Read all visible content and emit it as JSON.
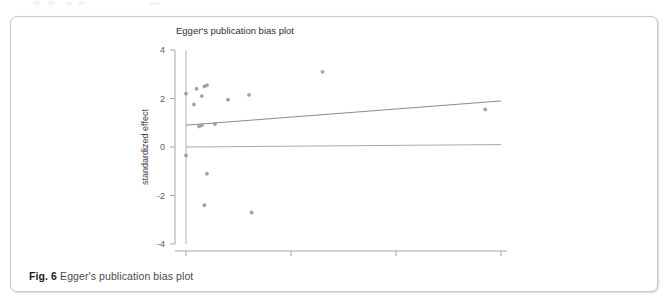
{
  "figure": {
    "caption_label": "Fig. 6",
    "caption_text": "Egger's publication bias plot"
  },
  "chart_data": {
    "type": "scatter",
    "title": "Egger's publication bias plot",
    "xlabel": "precision",
    "ylabel": "standardized effect",
    "xlim": [
      -1.5,
      61
    ],
    "ylim": [
      -4.3,
      4.3
    ],
    "xticks": [
      0,
      20,
      40,
      60
    ],
    "xtick_labels": [
      "0",
      "20",
      "40",
      "60"
    ],
    "yticks": [
      4,
      2,
      0,
      -2,
      -4
    ],
    "ytick_labels": [
      "4",
      "2",
      "0",
      "-2",
      "-4"
    ],
    "grid": false,
    "legend": "none",
    "x": [
      0,
      0,
      1.5,
      2,
      2.5,
      3,
      3,
      3.5,
      3.5,
      4,
      4,
      5.5,
      8,
      12,
      12.5,
      26,
      57
    ],
    "y": [
      2.2,
      -0.35,
      1.75,
      2.4,
      0.85,
      2.1,
      0.9,
      2.5,
      -2.4,
      2.55,
      -1.1,
      0.95,
      1.95,
      2.15,
      -2.7,
      3.1,
      1.55
    ],
    "points": [
      {
        "precision": 0,
        "standardized_effect": 2.2
      },
      {
        "precision": 0,
        "standardized_effect": -0.35
      },
      {
        "precision": 1.5,
        "standardized_effect": 1.75
      },
      {
        "precision": 2,
        "standardized_effect": 2.4
      },
      {
        "precision": 2.5,
        "standardized_effect": 0.85
      },
      {
        "precision": 3,
        "standardized_effect": 2.1
      },
      {
        "precision": 3,
        "standardized_effect": 0.9
      },
      {
        "precision": 3.5,
        "standardized_effect": 2.5
      },
      {
        "precision": 3.5,
        "standardized_effect": -2.4
      },
      {
        "precision": 4,
        "standardized_effect": 2.55
      },
      {
        "precision": 4,
        "standardized_effect": -1.1
      },
      {
        "precision": 5.5,
        "standardized_effect": 0.95
      },
      {
        "precision": 8,
        "standardized_effect": 1.95
      },
      {
        "precision": 12,
        "standardized_effect": 2.15
      },
      {
        "precision": 12.5,
        "standardized_effect": -2.7
      },
      {
        "precision": 26,
        "standardized_effect": 3.1
      },
      {
        "precision": 57,
        "standardized_effect": 1.55
      }
    ],
    "regression_line": {
      "name": "Egger regression line",
      "x": [
        0,
        60
      ],
      "y": [
        0.9,
        1.9
      ],
      "intercept": 0.9,
      "slope": 0.0167
    },
    "reference_line": {
      "name": "null effect reference line",
      "x": [
        0,
        60
      ],
      "y": [
        0.0,
        0.1
      ]
    },
    "vertical_axis_line": {
      "name": "vertical axis line at precision 0",
      "x": [
        0,
        0
      ],
      "y": [
        -4,
        4
      ]
    }
  }
}
